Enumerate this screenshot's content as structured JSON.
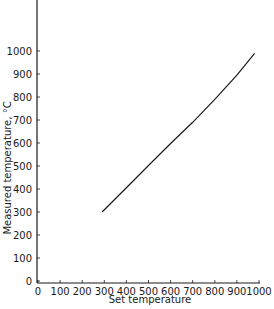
{
  "chart_data": {
    "type": "line",
    "title": "",
    "xlabel": "Set temperature",
    "ylabel": "Measured temperature, °C",
    "xlim": [
      0,
      1000
    ],
    "ylim": [
      0,
      1000
    ],
    "xticks": [
      0,
      100,
      200,
      300,
      400,
      500,
      600,
      700,
      800,
      900,
      1000
    ],
    "yticks": [
      0,
      100,
      200,
      300,
      400,
      500,
      600,
      700,
      800,
      900,
      1000
    ],
    "grid": false,
    "legend": null,
    "series": [
      {
        "name": "Measured vs set temperature",
        "x": [
          290,
          400,
          500,
          600,
          700,
          800,
          900,
          980
        ],
        "y": [
          300,
          405,
          502,
          598,
          690,
          790,
          895,
          990
        ]
      }
    ]
  },
  "axes": {
    "xlabel": "Set temperature",
    "ylabel": "Measured temperature, °C"
  }
}
